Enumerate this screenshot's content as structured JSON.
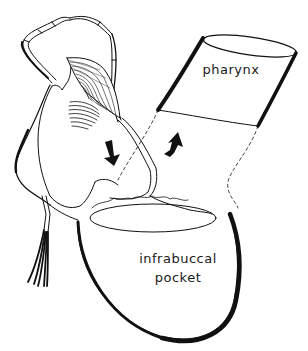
{
  "figure": {
    "type": "anatomical-illustration",
    "labels": {
      "pharynx": "pharynx",
      "pocket_line1": "infrabuccal",
      "pocket_line2": "pocket"
    },
    "arrows": [
      {
        "name": "downward-arrow",
        "direction": "down",
        "meaning": "food flows into infrabuccal pocket"
      },
      {
        "name": "upward-arrow",
        "direction": "up",
        "meaning": "liquid flows into pharynx"
      }
    ],
    "colors": {
      "ink": "#111111",
      "background": "#ffffff"
    }
  }
}
